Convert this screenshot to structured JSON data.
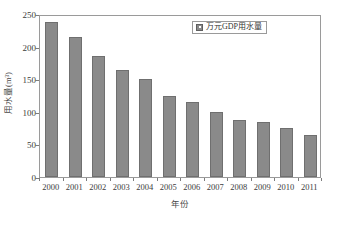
{
  "chart_data": {
    "type": "bar",
    "title": "",
    "xlabel": "年份",
    "ylabel": "用水量(m³)",
    "categories": [
      "2000",
      "2001",
      "2002",
      "2003",
      "2004",
      "2005",
      "2006",
      "2007",
      "2008",
      "2009",
      "2010",
      "2011"
    ],
    "values": [
      238,
      214,
      185,
      164,
      150,
      125,
      115,
      100,
      87,
      84,
      75,
      64
    ],
    "series": [
      {
        "name": "万元GDP用水量",
        "values": [
          238,
          214,
          185,
          164,
          150,
          125,
          115,
          100,
          87,
          84,
          75,
          64
        ]
      }
    ],
    "ylim": [
      0,
      250
    ],
    "yticks": [
      0,
      50,
      100,
      150,
      200,
      250
    ],
    "ytick_labels": [
      "0",
      "50",
      "100",
      "150",
      "200",
      "250"
    ],
    "grid": false,
    "legend": {
      "position": "top-right",
      "entries": [
        "万元GDP用水量"
      ]
    },
    "colors": {
      "bar_fill": "#8a8a8a",
      "bar_edge": "#6f6f6f",
      "axis": "#9a9a9a",
      "text": "#3c3c3c",
      "background": "#ffffff"
    }
  },
  "legend": {
    "label": "万元GDP用水量"
  },
  "axes": {
    "x_title": "年份",
    "y_title": "用水量(m³)"
  }
}
